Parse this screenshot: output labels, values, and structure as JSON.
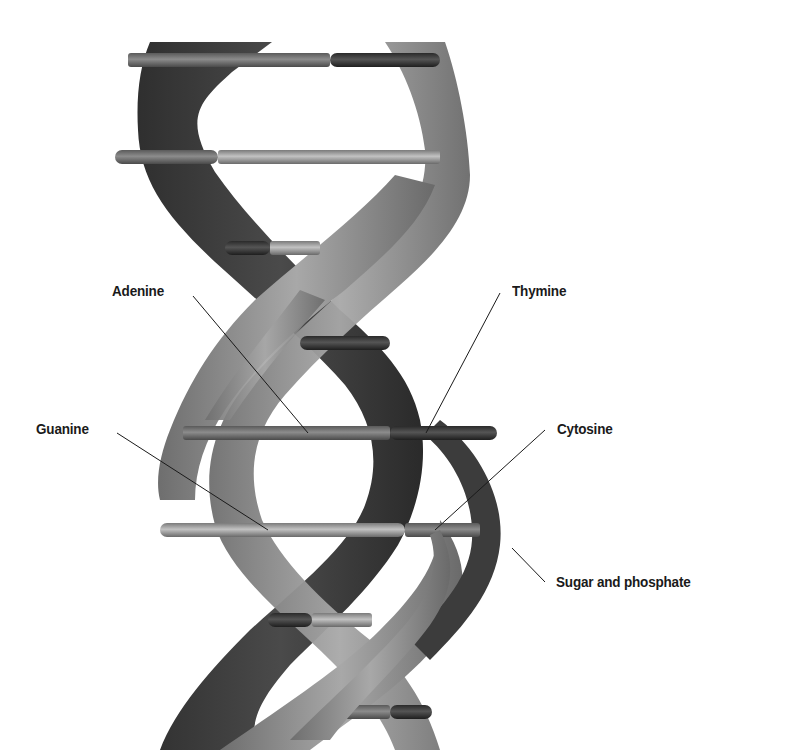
{
  "diagram": {
    "colors": {
      "background": "#ffffff",
      "strand_dark": "#3a3a3a",
      "strand_mid": "#5e5e5e",
      "strand_light": "#9a9a9a",
      "adenine": "#7a7a7a",
      "thymine": "#3c3c3c",
      "guanine": "#9c9c9c",
      "cytosine": "#b0b0b0",
      "leader_line": "#1a1a1a",
      "label_text": "#1a1a1a"
    },
    "labels": {
      "adenine": "Adenine",
      "thymine": "Thymine",
      "guanine": "Guanine",
      "cytosine": "Cytosine",
      "sugar_phosphate": "Sugar and phosphate"
    },
    "base_pairs": [
      {
        "y": 60,
        "x1": 128,
        "x2": 440,
        "split": 330,
        "left": "light-mid",
        "right": "dark"
      },
      {
        "y": 157,
        "x1": 115,
        "x2": 440,
        "split": 218,
        "left": "mid",
        "right": "light"
      },
      {
        "y": 248,
        "x1": 225,
        "x2": 320,
        "split": 270,
        "left": "dark",
        "right": "light"
      },
      {
        "y": 343,
        "x1": 300,
        "x2": 390,
        "split": 340,
        "left": "dark",
        "right": "dark"
      },
      {
        "y": 433,
        "x1": 183,
        "x2": 497,
        "split": 390,
        "left": "adenine",
        "right": "thymine"
      },
      {
        "y": 530,
        "x1": 160,
        "x2": 480,
        "split": 405,
        "left": "guanine",
        "right": "cytosine"
      },
      {
        "y": 620,
        "x1": 268,
        "x2": 380,
        "split": 312,
        "left": "dark",
        "right": "light"
      },
      {
        "y": 712,
        "x1": 345,
        "x2": 432,
        "split": 390,
        "left": "mid",
        "right": "dark"
      }
    ]
  }
}
